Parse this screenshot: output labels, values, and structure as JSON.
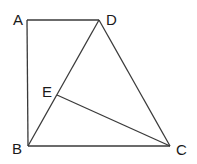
{
  "diagram": {
    "type": "geometry",
    "stroke_color": "#3a3a3a",
    "label_color": "#1a1a1a",
    "points": {
      "A": {
        "x": 27,
        "y": 20
      },
      "D": {
        "x": 99,
        "y": 20
      },
      "B": {
        "x": 28,
        "y": 146
      },
      "C": {
        "x": 170,
        "y": 146
      },
      "E": {
        "x": 57,
        "y": 95
      }
    },
    "labels": [
      {
        "id": "A",
        "text": "A",
        "x": 13,
        "y": 25
      },
      {
        "id": "D",
        "text": "D",
        "x": 106,
        "y": 25
      },
      {
        "id": "E",
        "text": "E",
        "x": 42,
        "y": 97
      },
      {
        "id": "B",
        "text": "B",
        "x": 12,
        "y": 154
      },
      {
        "id": "C",
        "text": "C",
        "x": 176,
        "y": 155
      }
    ],
    "segments": [
      {
        "name": "AD",
        "from": "A",
        "to": "D"
      },
      {
        "name": "AB",
        "from": "A",
        "to": "B"
      },
      {
        "name": "BC",
        "from": "B",
        "to": "C"
      },
      {
        "name": "BD",
        "from": "B",
        "to": "D"
      },
      {
        "name": "DC",
        "from": "D",
        "to": "C"
      },
      {
        "name": "EC",
        "from": "E",
        "to": "C"
      }
    ]
  }
}
